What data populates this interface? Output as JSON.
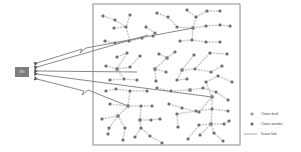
{
  "base_station": {
    "label": "BS",
    "x": 15,
    "y": 67,
    "w": 14,
    "h": 10,
    "color": "#7d7d7d"
  },
  "field": {
    "x": 93,
    "y": 4,
    "w": 147,
    "h": 141,
    "border": "#8a8a8a"
  },
  "colors": {
    "cluster_head": "#8c8c8c",
    "cluster_member": "#6a6a6a",
    "sensor_link": "#c9c9c9",
    "long_link": "#7a7a7a"
  },
  "legend": {
    "items": [
      {
        "label": "Cluster head",
        "type": "dot-light"
      },
      {
        "label": "Cluster member",
        "type": "dot-dark"
      },
      {
        "label": "Sensor link",
        "type": "line"
      }
    ]
  },
  "links_to_bs": [
    {
      "from": [
        193,
        28
      ],
      "to": [
        37,
        63
      ],
      "zigzag": [
        84,
        50
      ]
    },
    {
      "from": [
        148,
        35
      ],
      "to": [
        37,
        67
      ]
    },
    {
      "from": [
        137,
        72
      ],
      "to": [
        37,
        71
      ]
    },
    {
      "from": [
        212,
        97
      ],
      "to": [
        37,
        74
      ]
    },
    {
      "from": [
        128,
        106
      ],
      "to": [
        37,
        79
      ],
      "zigzag": [
        86,
        92
      ]
    }
  ],
  "nodes": [
    [
      103,
      16
    ],
    [
      115,
      20
    ],
    [
      130,
      15
    ],
    [
      157,
      13
    ],
    [
      168,
      17
    ],
    [
      187,
      10
    ],
    [
      207,
      11
    ],
    [
      220,
      11
    ],
    [
      196,
      17
    ],
    [
      114,
      28
    ],
    [
      126,
      27
    ],
    [
      146,
      27
    ],
    [
      155,
      33
    ],
    [
      177,
      27
    ],
    [
      193,
      28
    ],
    [
      206,
      26
    ],
    [
      220,
      25
    ],
    [
      230,
      26
    ],
    [
      105,
      41
    ],
    [
      115,
      43
    ],
    [
      129,
      41
    ],
    [
      142,
      38
    ],
    [
      153,
      36
    ],
    [
      180,
      41
    ],
    [
      192,
      40
    ],
    [
      206,
      42
    ],
    [
      220,
      42
    ],
    [
      117,
      57
    ],
    [
      127,
      53
    ],
    [
      140,
      56
    ],
    [
      159,
      54
    ],
    [
      167,
      58
    ],
    [
      175,
      52
    ],
    [
      194,
      55
    ],
    [
      210,
      53
    ],
    [
      227,
      54
    ],
    [
      106,
      66
    ],
    [
      117,
      69
    ],
    [
      130,
      67
    ],
    [
      155,
      69
    ],
    [
      166,
      72
    ],
    [
      182,
      70
    ],
    [
      195,
      69
    ],
    [
      211,
      72
    ],
    [
      222,
      66
    ],
    [
      110,
      80
    ],
    [
      124,
      79
    ],
    [
      137,
      80
    ],
    [
      156,
      81
    ],
    [
      177,
      80
    ],
    [
      187,
      79
    ],
    [
      206,
      82
    ],
    [
      218,
      76
    ],
    [
      232,
      82
    ],
    [
      106,
      91
    ],
    [
      116,
      89
    ],
    [
      130,
      91
    ],
    [
      147,
      91
    ],
    [
      157,
      88
    ],
    [
      171,
      91
    ],
    [
      190,
      90
    ],
    [
      203,
      88
    ],
    [
      216,
      92
    ],
    [
      228,
      100
    ],
    [
      110,
      104
    ],
    [
      128,
      106
    ],
    [
      141,
      106
    ],
    [
      152,
      106
    ],
    [
      169,
      104
    ],
    [
      182,
      108
    ],
    [
      199,
      112
    ],
    [
      212,
      97
    ],
    [
      228,
      111
    ],
    [
      102,
      119
    ],
    [
      118,
      116
    ],
    [
      140,
      120
    ],
    [
      151,
      120
    ],
    [
      160,
      119
    ],
    [
      177,
      114
    ],
    [
      196,
      111
    ],
    [
      212,
      109
    ],
    [
      229,
      121
    ],
    [
      109,
      128
    ],
    [
      125,
      128
    ],
    [
      141,
      128
    ],
    [
      178,
      127
    ],
    [
      199,
      125
    ],
    [
      211,
      124
    ],
    [
      224,
      124
    ],
    [
      108,
      134
    ],
    [
      123,
      140
    ],
    [
      135,
      137
    ],
    [
      150,
      136
    ],
    [
      162,
      143
    ],
    [
      188,
      139
    ],
    [
      200,
      135
    ],
    [
      214,
      133
    ],
    [
      223,
      141
    ]
  ],
  "heads": [
    [
      193,
      28
    ],
    [
      130,
      41
    ],
    [
      167,
      58
    ],
    [
      117,
      69
    ],
    [
      182,
      70
    ],
    [
      155,
      69
    ],
    [
      212,
      97
    ],
    [
      128,
      106
    ],
    [
      118,
      116
    ],
    [
      211,
      124
    ],
    [
      140,
      120
    ],
    [
      190,
      90
    ]
  ],
  "edges": [
    [
      [
        103,
        16
      ],
      [
        115,
        20
      ]
    ],
    [
      [
        115,
        20
      ],
      [
        126,
        27
      ]
    ],
    [
      [
        130,
        15
      ],
      [
        126,
        27
      ]
    ],
    [
      [
        126,
        27
      ],
      [
        130,
        41
      ]
    ],
    [
      [
        114,
        28
      ],
      [
        126,
        27
      ]
    ],
    [
      [
        157,
        13
      ],
      [
        168,
        17
      ]
    ],
    [
      [
        168,
        17
      ],
      [
        177,
        27
      ]
    ],
    [
      [
        177,
        27
      ],
      [
        193,
        28
      ]
    ],
    [
      [
        187,
        10
      ],
      [
        196,
        17
      ]
    ],
    [
      [
        196,
        17
      ],
      [
        193,
        28
      ]
    ],
    [
      [
        207,
        11
      ],
      [
        220,
        11
      ]
    ],
    [
      [
        196,
        17
      ],
      [
        207,
        11
      ]
    ],
    [
      [
        193,
        28
      ],
      [
        206,
        26
      ]
    ],
    [
      [
        206,
        26
      ],
      [
        220,
        25
      ]
    ],
    [
      [
        220,
        25
      ],
      [
        230,
        26
      ]
    ],
    [
      [
        146,
        27
      ],
      [
        155,
        33
      ]
    ],
    [
      [
        155,
        33
      ],
      [
        153,
        36
      ]
    ],
    [
      [
        142,
        38
      ],
      [
        130,
        41
      ]
    ],
    [
      [
        105,
        41
      ],
      [
        115,
        43
      ]
    ],
    [
      [
        115,
        43
      ],
      [
        130,
        41
      ]
    ],
    [
      [
        180,
        41
      ],
      [
        192,
        40
      ]
    ],
    [
      [
        192,
        40
      ],
      [
        206,
        42
      ]
    ],
    [
      [
        206,
        42
      ],
      [
        220,
        42
      ]
    ],
    [
      [
        193,
        28
      ],
      [
        192,
        40
      ]
    ],
    [
      [
        117,
        57
      ],
      [
        127,
        53
      ]
    ],
    [
      [
        127,
        53
      ],
      [
        117,
        69
      ]
    ],
    [
      [
        140,
        56
      ],
      [
        130,
        67
      ]
    ],
    [
      [
        130,
        67
      ],
      [
        117,
        69
      ]
    ],
    [
      [
        106,
        66
      ],
      [
        117,
        69
      ]
    ],
    [
      [
        159,
        54
      ],
      [
        167,
        58
      ]
    ],
    [
      [
        167,
        58
      ],
      [
        175,
        52
      ]
    ],
    [
      [
        167,
        58
      ],
      [
        155,
        69
      ]
    ],
    [
      [
        155,
        69
      ],
      [
        166,
        72
      ]
    ],
    [
      [
        194,
        55
      ],
      [
        182,
        70
      ]
    ],
    [
      [
        210,
        53
      ],
      [
        227,
        54
      ]
    ],
    [
      [
        210,
        53
      ],
      [
        195,
        69
      ]
    ],
    [
      [
        182,
        70
      ],
      [
        195,
        69
      ]
    ],
    [
      [
        195,
        69
      ],
      [
        211,
        72
      ]
    ],
    [
      [
        211,
        72
      ],
      [
        222,
        66
      ]
    ],
    [
      [
        110,
        80
      ],
      [
        124,
        79
      ]
    ],
    [
      [
        124,
        79
      ],
      [
        117,
        69
      ]
    ],
    [
      [
        124,
        79
      ],
      [
        137,
        80
      ]
    ],
    [
      [
        156,
        81
      ],
      [
        155,
        69
      ]
    ],
    [
      [
        177,
        80
      ],
      [
        182,
        70
      ]
    ],
    [
      [
        177,
        80
      ],
      [
        187,
        79
      ]
    ],
    [
      [
        206,
        82
      ],
      [
        218,
        76
      ]
    ],
    [
      [
        218,
        76
      ],
      [
        232,
        82
      ]
    ],
    [
      [
        206,
        82
      ],
      [
        212,
        97
      ]
    ],
    [
      [
        106,
        91
      ],
      [
        116,
        89
      ]
    ],
    [
      [
        116,
        89
      ],
      [
        130,
        91
      ]
    ],
    [
      [
        130,
        91
      ],
      [
        147,
        91
      ]
    ],
    [
      [
        157,
        88
      ],
      [
        171,
        91
      ]
    ],
    [
      [
        171,
        91
      ],
      [
        190,
        90
      ]
    ],
    [
      [
        190,
        90
      ],
      [
        203,
        88
      ]
    ],
    [
      [
        203,
        88
      ],
      [
        216,
        92
      ]
    ],
    [
      [
        216,
        92
      ],
      [
        228,
        100
      ]
    ],
    [
      [
        110,
        104
      ],
      [
        128,
        106
      ]
    ],
    [
      [
        128,
        106
      ],
      [
        141,
        106
      ]
    ],
    [
      [
        141,
        106
      ],
      [
        152,
        106
      ]
    ],
    [
      [
        128,
        106
      ],
      [
        130,
        91
      ]
    ],
    [
      [
        169,
        104
      ],
      [
        182,
        108
      ]
    ],
    [
      [
        182,
        108
      ],
      [
        199,
        112
      ]
    ],
    [
      [
        212,
        97
      ],
      [
        212,
        109
      ]
    ],
    [
      [
        212,
        109
      ],
      [
        228,
        111
      ]
    ],
    [
      [
        212,
        97
      ],
      [
        199,
        112
      ]
    ],
    [
      [
        102,
        119
      ],
      [
        118,
        116
      ]
    ],
    [
      [
        118,
        116
      ],
      [
        128,
        106
      ]
    ],
    [
      [
        140,
        120
      ],
      [
        151,
        120
      ]
    ],
    [
      [
        151,
        120
      ],
      [
        160,
        119
      ]
    ],
    [
      [
        141,
        106
      ],
      [
        140,
        120
      ]
    ],
    [
      [
        177,
        114
      ],
      [
        196,
        111
      ]
    ],
    [
      [
        196,
        111
      ],
      [
        212,
        109
      ]
    ],
    [
      [
        229,
        121
      ],
      [
        224,
        124
      ]
    ],
    [
      [
        109,
        128
      ],
      [
        118,
        116
      ]
    ],
    [
      [
        125,
        128
      ],
      [
        118,
        116
      ]
    ],
    [
      [
        141,
        128
      ],
      [
        140,
        120
      ]
    ],
    [
      [
        178,
        127
      ],
      [
        177,
        114
      ]
    ],
    [
      [
        199,
        125
      ],
      [
        211,
        124
      ]
    ],
    [
      [
        211,
        124
      ],
      [
        224,
        124
      ]
    ],
    [
      [
        211,
        124
      ],
      [
        212,
        109
      ]
    ],
    [
      [
        108,
        134
      ],
      [
        109,
        128
      ]
    ],
    [
      [
        123,
        140
      ],
      [
        125,
        128
      ]
    ],
    [
      [
        135,
        137
      ],
      [
        141,
        128
      ]
    ],
    [
      [
        150,
        136
      ],
      [
        141,
        128
      ]
    ],
    [
      [
        162,
        143
      ],
      [
        150,
        136
      ]
    ],
    [
      [
        188,
        139
      ],
      [
        199,
        125
      ]
    ],
    [
      [
        200,
        135
      ],
      [
        211,
        124
      ]
    ],
    [
      [
        214,
        133
      ],
      [
        211,
        124
      ]
    ],
    [
      [
        223,
        141
      ],
      [
        214,
        133
      ]
    ]
  ]
}
